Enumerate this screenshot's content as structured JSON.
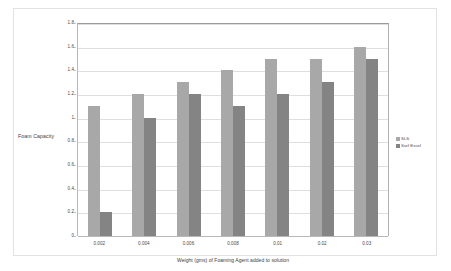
{
  "chart_data": {
    "type": "bar",
    "title": "",
    "xlabel": "Weight (gms) of Foaming Agent added to solution",
    "ylabel": "Foam Capacity",
    "categories": [
      "0.002",
      "0.004",
      "0.006",
      "0.008",
      "0.01",
      "0.02",
      "0.03"
    ],
    "series": [
      {
        "name": "SLS",
        "color": "#a8a8a8",
        "values": [
          1.1,
          1.2,
          1.3,
          1.4,
          1.5,
          1.5,
          1.6
        ]
      },
      {
        "name": "Surf Excel",
        "color": "#848484",
        "values": [
          0.2,
          1.0,
          1.2,
          1.1,
          1.2,
          1.3,
          1.5
        ]
      }
    ],
    "ylim": [
      0,
      1.8
    ],
    "ytick_step": 0.2,
    "ytick_labels": [
      "0",
      "0.2",
      "0.4",
      "0.6",
      "0.8",
      "1",
      "1.2",
      "1.4",
      "1.6",
      "1.8"
    ],
    "grid": true,
    "grid_axis": "y",
    "legend_position": "right"
  },
  "legend": {
    "items": [
      {
        "label": "SLS"
      },
      {
        "label": "Surf Excel"
      }
    ]
  },
  "axes": {
    "y_title": "Foam Capacity",
    "x_title": "Weight (gms) of Foaming Agent added to solution"
  }
}
